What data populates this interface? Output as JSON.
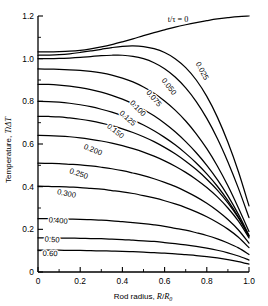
{
  "chart_data": {
    "type": "line",
    "title": "",
    "xlabel": "Rod radius, R/R₀",
    "ylabel": "Temperature, T/ΔT",
    "xlim": [
      0,
      1.0
    ],
    "ylim": [
      0,
      1.2
    ],
    "grid": false,
    "legend_position": "inline-curve-labels",
    "legend_title": "t/τ = 0",
    "x_ticks": [
      "0",
      "0.2",
      "0.4",
      "0.6",
      "0.8",
      "1.0"
    ],
    "x_tick_values": [
      0,
      0.2,
      0.4,
      0.6,
      0.8,
      1.0
    ],
    "x_minor_tick_values": [
      0.1,
      0.3,
      0.5,
      0.7,
      0.9
    ],
    "y_ticks": [
      "0",
      "0.2",
      "0.4",
      "0.6",
      "0.8",
      "1.0",
      "1.2"
    ],
    "y_tick_values": [
      0,
      0.2,
      0.4,
      0.6,
      0.8,
      1.0,
      1.2
    ],
    "y_minor_tick_values": [
      0.1,
      0.3,
      0.5,
      0.7,
      0.9,
      1.1
    ],
    "x": [
      0.0,
      0.05,
      0.1,
      0.15,
      0.2,
      0.25,
      0.3,
      0.35,
      0.4,
      0.45,
      0.5,
      0.55,
      0.6,
      0.65,
      0.7,
      0.75,
      0.8,
      0.85,
      0.9,
      0.95,
      1.0
    ],
    "series": [
      {
        "name": "0",
        "label": "t/τ = 0",
        "values": [
          1.032,
          1.032,
          1.033,
          1.035,
          1.039,
          1.046,
          1.055,
          1.066,
          1.079,
          1.093,
          1.108,
          1.122,
          1.135,
          1.148,
          1.159,
          1.169,
          1.178,
          1.186,
          1.192,
          1.197,
          1.2
        ]
      },
      {
        "name": "0.025",
        "label": "0.025",
        "values": [
          1.016,
          1.017,
          1.019,
          1.023,
          1.029,
          1.036,
          1.044,
          1.052,
          1.058,
          1.06,
          1.057,
          1.047,
          1.029,
          1.0,
          0.958,
          0.9,
          0.823,
          0.726,
          0.608,
          0.47,
          0.31
        ]
      },
      {
        "name": "0.050",
        "label": "0.050",
        "values": [
          1.0,
          1.0,
          1.001,
          1.003,
          1.006,
          1.01,
          1.014,
          1.016,
          1.016,
          1.011,
          1.0,
          0.981,
          0.953,
          0.914,
          0.863,
          0.799,
          0.72,
          0.626,
          0.516,
          0.392,
          0.255
        ]
      },
      {
        "name": "0.075",
        "label": "0.075",
        "values": [
          0.952,
          0.951,
          0.95,
          0.948,
          0.945,
          0.94,
          0.933,
          0.923,
          0.909,
          0.891,
          0.867,
          0.838,
          0.802,
          0.759,
          0.708,
          0.648,
          0.578,
          0.497,
          0.404,
          0.3,
          0.19
        ]
      },
      {
        "name": "0.100",
        "label": "0.100",
        "values": [
          0.88,
          0.879,
          0.876,
          0.871,
          0.864,
          0.855,
          0.843,
          0.828,
          0.81,
          0.788,
          0.762,
          0.732,
          0.697,
          0.657,
          0.611,
          0.559,
          0.5,
          0.433,
          0.357,
          0.27,
          0.172
        ]
      },
      {
        "name": "0.125",
        "label": "0.125",
        "values": [
          0.8,
          0.799,
          0.796,
          0.791,
          0.784,
          0.775,
          0.763,
          0.749,
          0.732,
          0.712,
          0.689,
          0.662,
          0.631,
          0.596,
          0.556,
          0.511,
          0.46,
          0.402,
          0.335,
          0.258,
          0.168
        ]
      },
      {
        "name": "0.150",
        "label": "0.150",
        "values": [
          0.73,
          0.729,
          0.727,
          0.722,
          0.716,
          0.708,
          0.698,
          0.686,
          0.671,
          0.654,
          0.634,
          0.611,
          0.584,
          0.554,
          0.519,
          0.48,
          0.435,
          0.384,
          0.324,
          0.253,
          0.168
        ]
      },
      {
        "name": "0.200",
        "label": "0.200",
        "values": [
          0.64,
          0.639,
          0.637,
          0.634,
          0.629,
          0.622,
          0.614,
          0.604,
          0.592,
          0.578,
          0.562,
          0.543,
          0.521,
          0.496,
          0.467,
          0.434,
          0.396,
          0.352,
          0.3,
          0.238,
          0.16
        ]
      },
      {
        "name": "0.250",
        "label": "0.250",
        "values": [
          0.51,
          0.509,
          0.508,
          0.505,
          0.502,
          0.497,
          0.491,
          0.484,
          0.475,
          0.464,
          0.452,
          0.437,
          0.42,
          0.401,
          0.378,
          0.352,
          0.322,
          0.287,
          0.246,
          0.197,
          0.135
        ]
      },
      {
        "name": "0.300",
        "label": "0.300",
        "values": [
          0.402,
          0.401,
          0.4,
          0.398,
          0.396,
          0.392,
          0.388,
          0.382,
          0.376,
          0.368,
          0.358,
          0.347,
          0.334,
          0.319,
          0.302,
          0.282,
          0.259,
          0.232,
          0.201,
          0.163,
          0.114
        ]
      },
      {
        "name": "0.400",
        "label": "0.400",
        "values": [
          0.25,
          0.25,
          0.249,
          0.248,
          0.247,
          0.245,
          0.243,
          0.24,
          0.236,
          0.232,
          0.227,
          0.221,
          0.214,
          0.205,
          0.196,
          0.184,
          0.171,
          0.155,
          0.136,
          0.113,
          0.082
        ]
      },
      {
        "name": "0.50",
        "label": "0.50",
        "values": [
          0.16,
          0.16,
          0.159,
          0.159,
          0.158,
          0.157,
          0.156,
          0.154,
          0.152,
          0.149,
          0.146,
          0.143,
          0.138,
          0.133,
          0.127,
          0.12,
          0.112,
          0.102,
          0.09,
          0.075,
          0.056
        ]
      },
      {
        "name": "0.60",
        "label": "0.60",
        "values": [
          0.102,
          0.102,
          0.102,
          0.101,
          0.101,
          0.1,
          0.099,
          0.098,
          0.097,
          0.095,
          0.093,
          0.091,
          0.088,
          0.085,
          0.081,
          0.077,
          0.072,
          0.066,
          0.058,
          0.049,
          0.037
        ]
      }
    ],
    "curve_labels": [
      {
        "text": "t/τ = 0",
        "x": 178,
        "y": 22,
        "rotate": 0
      },
      {
        "text": "0.025",
        "x": 200,
        "y": 72,
        "rotate": 62
      },
      {
        "text": "0.050",
        "x": 167,
        "y": 88,
        "rotate": 52
      },
      {
        "text": "0.075",
        "x": 152,
        "y": 100,
        "rotate": 50
      },
      {
        "text": "0.100",
        "x": 136,
        "y": 110,
        "rotate": 46
      },
      {
        "text": "0.125",
        "x": 126,
        "y": 120,
        "rotate": 42
      },
      {
        "text": "0.150",
        "x": 114,
        "y": 133,
        "rotate": 38
      },
      {
        "text": "0.200",
        "x": 92,
        "y": 152,
        "rotate": 22
      },
      {
        "text": "0.250",
        "x": 78,
        "y": 176,
        "rotate": 18
      },
      {
        "text": "0.300",
        "x": 66,
        "y": 196,
        "rotate": 12
      },
      {
        "text": "0.400",
        "x": 58,
        "y": 223,
        "rotate": 5
      },
      {
        "text": "0.50",
        "x": 52,
        "y": 242,
        "rotate": 3
      },
      {
        "text": "0.60",
        "x": 50,
        "y": 256,
        "rotate": 2
      }
    ]
  }
}
